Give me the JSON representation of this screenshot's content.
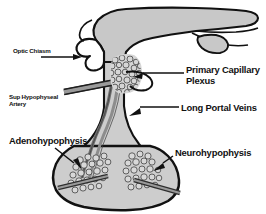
{
  "diagram": {
    "background_color": "#ffffff",
    "outline_color": "#111111",
    "tissue_fill": "#c8c8c8",
    "gland_fill": "#cdcdcd",
    "vessel_fill": "#8a8a8a",
    "plexus_fill": "#d4d4d4",
    "labels": {
      "optic_chiasm": "Optic Chiasm",
      "sup_hypophyseal_artery": "Sup Hypophyseal\nArtery",
      "primary_capillary_plexus": "Primary Capillary\nPlexus",
      "long_portal_veins": "Long Portal Veins",
      "adenohypophysis": "Adenohypophysis",
      "neurohypophysis": "Neurohypophysis"
    }
  }
}
